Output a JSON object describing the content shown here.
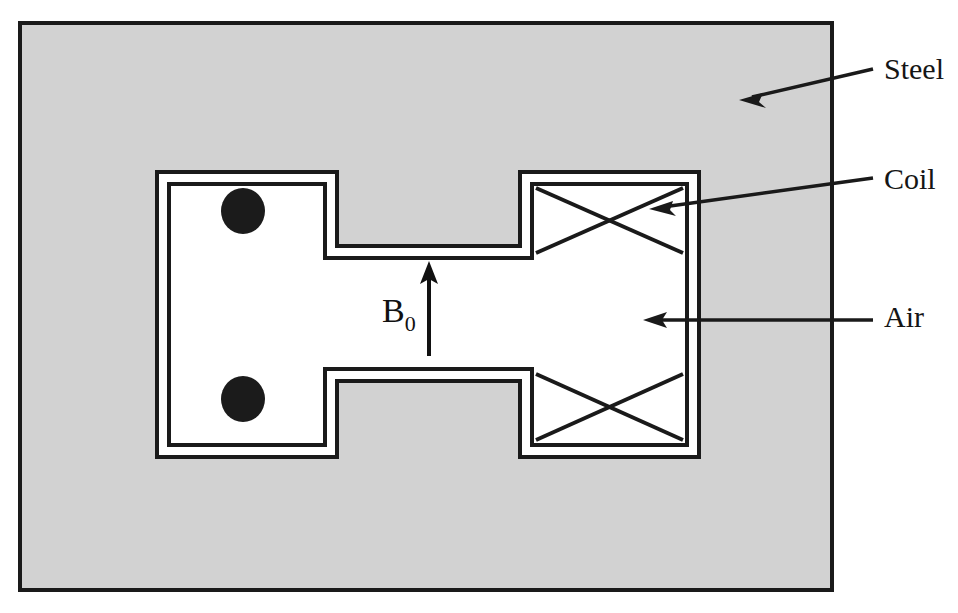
{
  "figure": {
    "kind": "cross-section-diagram",
    "background_color": "#ffffff"
  },
  "regions": {
    "steel": {
      "label": "Steel",
      "fill_color": "#d2d2d2",
      "stroke_color": "#1a1a1a"
    },
    "air": {
      "label": "Air",
      "fill_color": "#ffffff",
      "stroke_color": "#1a1a1a"
    }
  },
  "callouts": [
    {
      "id": "steel",
      "label": "Steel",
      "text_x": 884,
      "text_y": 82,
      "line": {
        "x1": 873,
        "y1": 69,
        "x2": 747,
        "y2": 98
      },
      "arrow_angle_deg": 167
    },
    {
      "id": "coil",
      "label": "Coil",
      "text_x": 884,
      "text_y": 192,
      "line": {
        "x1": 873,
        "y1": 178,
        "x2": 657,
        "y2": 209
      },
      "arrow_angle_deg": 172
    },
    {
      "id": "air",
      "label": "Air",
      "text_x": 884,
      "text_y": 320,
      "line": {
        "x1": 873,
        "y1": 320,
        "x2": 649,
        "y2": 320
      },
      "arrow_angle_deg": 180
    }
  ],
  "field_arrow": {
    "label_base": "B",
    "label_subscript": "0",
    "label_full": "B0",
    "label_x": 384,
    "label_y": 310,
    "shaft": {
      "x": 429,
      "y_bottom": 356,
      "y_top": 268
    },
    "direction": "up",
    "color": "#111111"
  },
  "magnets": [
    {
      "id": "magnet-top-left",
      "marker": "current-out-of-page-dot",
      "dot_cx": 243,
      "dot_cy": 211,
      "dot_rx": 22,
      "dot_ry": 23,
      "dot_color": "#1b1b1b"
    },
    {
      "id": "magnet-bottom-left",
      "marker": "current-out-of-page-dot",
      "dot_cx": 243,
      "dot_cy": 399,
      "dot_rx": 22,
      "dot_ry": 23,
      "dot_color": "#1b1b1b"
    }
  ],
  "coils": [
    {
      "id": "coil-top-right",
      "marker": "cross-hatch-x"
    },
    {
      "id": "coil-bottom-right",
      "marker": "cross-hatch-x"
    }
  ]
}
